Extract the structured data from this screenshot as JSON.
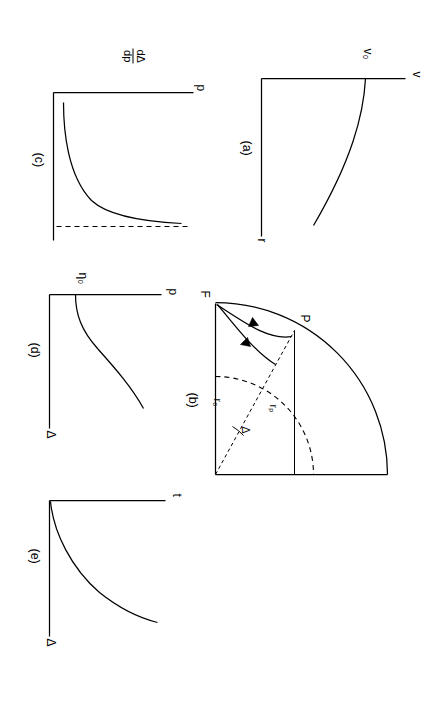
{
  "figure": {
    "panels": [
      {
        "id": "a",
        "caption": "(a)",
        "y_axis_label": "v",
        "x_axis_label": "r",
        "marked_value": "v₀",
        "description": "monotonically increasing curve starting at v0 on the vertical axis"
      },
      {
        "id": "b",
        "caption": "(b)",
        "labels": {
          "apex": "F",
          "point": "P",
          "radius_p": "rₚ",
          "radius_0": "r₀",
          "angle": "Δ"
        },
        "description": "quarter-disc sector with curved ray trajectories from F to P, dashed arc of radius r0 and dashed radius r_p"
      },
      {
        "id": "c",
        "caption": "(c)",
        "y_axis_label_numerator": "dΔ",
        "y_axis_label_denominator": "dp",
        "x_axis_label": "p",
        "description": "curve rising steeply then flattening toward a dashed horizontal asymptote"
      },
      {
        "id": "d",
        "caption": "(d)",
        "y_axis_label": "p",
        "x_axis_label": "Δ",
        "marked_value": "η₀",
        "description": "curve starting at eta0 on the vertical axis, rising with increasing slope"
      },
      {
        "id": "e",
        "caption": "(e)",
        "y_axis_label": "t",
        "x_axis_label": "Δ",
        "description": "curve rising from the origin with increasing slope"
      }
    ]
  }
}
